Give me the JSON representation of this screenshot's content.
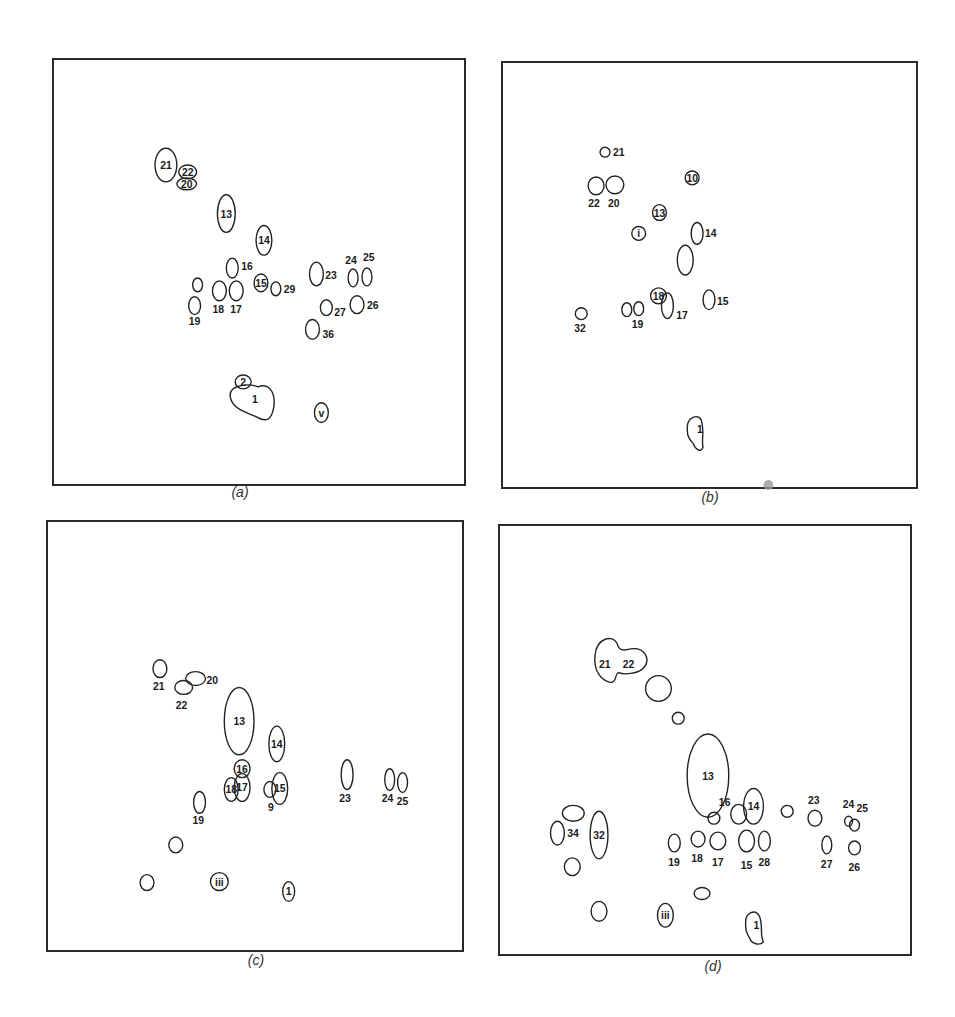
{
  "figure": {
    "panels": [
      {
        "id": "a",
        "caption": "(a)",
        "spots": [
          {
            "label": "21",
            "cx": 113,
            "cy": 106,
            "rx": 11,
            "ry": 17,
            "label_inside": true
          },
          {
            "label": "22",
            "cx": 135,
            "cy": 113,
            "rx": 9,
            "ry": 7,
            "label_inside": true
          },
          {
            "label": "20",
            "cx": 134,
            "cy": 125,
            "rx": 10,
            "ry": 6,
            "label_inside": true
          },
          {
            "label": "13",
            "cx": 174,
            "cy": 155,
            "rx": 9,
            "ry": 19,
            "label_inside": true
          },
          {
            "label": "14",
            "cx": 212,
            "cy": 182,
            "rx": 8,
            "ry": 15,
            "label_inside": true
          },
          {
            "label": "16",
            "cx": 180,
            "cy": 210,
            "rx": 6,
            "ry": 10,
            "label_x": 189,
            "label_y": 212
          },
          {
            "label": "15",
            "cx": 209,
            "cy": 225,
            "rx": 7,
            "ry": 9,
            "label_inside": true
          },
          {
            "label": "29",
            "cx": 224,
            "cy": 231,
            "rx": 5,
            "ry": 7,
            "label_x": 232,
            "label_y": 235
          },
          {
            "label": "",
            "cx": 145,
            "cy": 227,
            "rx": 5,
            "ry": 7
          },
          {
            "label": "19",
            "cx": 142,
            "cy": 248,
            "rx": 6,
            "ry": 9,
            "label_x": 136,
            "label_y": 268
          },
          {
            "label": "18",
            "cx": 167,
            "cy": 233,
            "rx": 7,
            "ry": 10,
            "label_x": 160,
            "label_y": 255
          },
          {
            "label": "17",
            "cx": 184,
            "cy": 233,
            "rx": 7,
            "ry": 10,
            "label_x": 178,
            "label_y": 255
          },
          {
            "label": "23",
            "cx": 265,
            "cy": 216,
            "rx": 7,
            "ry": 12,
            "label_x": 274,
            "label_y": 221
          },
          {
            "label": "24",
            "cx": 302,
            "cy": 220,
            "rx": 5,
            "ry": 9,
            "label_x": 294,
            "label_y": 206
          },
          {
            "label": "25",
            "cx": 316,
            "cy": 219,
            "rx": 5,
            "ry": 9,
            "label_x": 312,
            "label_y": 203
          },
          {
            "label": "26",
            "cx": 306,
            "cy": 247,
            "rx": 7,
            "ry": 9,
            "label_x": 316,
            "label_y": 251
          },
          {
            "label": "27",
            "cx": 275,
            "cy": 250,
            "rx": 6,
            "ry": 8,
            "label_x": 283,
            "label_y": 258
          },
          {
            "label": "36",
            "cx": 261,
            "cy": 272,
            "rx": 7,
            "ry": 10,
            "label_x": 271,
            "label_y": 281
          },
          {
            "label": "2",
            "cx": 191,
            "cy": 325,
            "rx": 8,
            "ry": 7,
            "label_inside": true
          },
          {
            "label": "1",
            "shape": "blob1",
            "label_x": 200,
            "label_y": 346
          },
          {
            "label": "v",
            "cx": 270,
            "cy": 356,
            "rx": 7,
            "ry": 10,
            "label_inside": true
          }
        ],
        "stains": []
      },
      {
        "id": "b",
        "caption": "(b)",
        "spots": [
          {
            "label": "21",
            "cx": 103,
            "cy": 90,
            "rx": 5,
            "ry": 5,
            "label_x": 111,
            "label_y": 94
          },
          {
            "label": "22",
            "cx": 94,
            "cy": 124,
            "rx": 8,
            "ry": 9,
            "label_x": 86,
            "label_y": 145
          },
          {
            "label": "20",
            "cx": 113,
            "cy": 123,
            "rx": 9,
            "ry": 9,
            "label_x": 106,
            "label_y": 145
          },
          {
            "label": "10",
            "cx": 191,
            "cy": 116,
            "rx": 7,
            "ry": 7,
            "label_inside": true
          },
          {
            "label": "13",
            "cx": 158,
            "cy": 151,
            "rx": 7,
            "ry": 8,
            "label_inside": true
          },
          {
            "label": "i",
            "cx": 137,
            "cy": 172,
            "rx": 7,
            "ry": 7,
            "label_inside": true
          },
          {
            "label": "14",
            "cx": 196,
            "cy": 172,
            "rx": 6,
            "ry": 11,
            "label_x": 204,
            "label_y": 176
          },
          {
            "label": "",
            "cx": 184,
            "cy": 199,
            "rx": 8,
            "ry": 15
          },
          {
            "label": "18",
            "cx": 157,
            "cy": 235,
            "rx": 8,
            "ry": 8,
            "label_inside": true
          },
          {
            "label": "17",
            "cx": 166,
            "cy": 245,
            "rx": 6,
            "ry": 13,
            "label_x": 175,
            "label_y": 258
          },
          {
            "label": "15",
            "cx": 208,
            "cy": 239,
            "rx": 6,
            "ry": 10,
            "label_x": 216,
            "label_y": 244
          },
          {
            "label": "",
            "cx": 125,
            "cy": 249,
            "rx": 5,
            "ry": 7
          },
          {
            "label": "19",
            "cx": 137,
            "cy": 248,
            "rx": 5,
            "ry": 7,
            "label_x": 130,
            "label_y": 268
          },
          {
            "label": "32",
            "cx": 79,
            "cy": 253,
            "rx": 6,
            "ry": 6,
            "label_x": 72,
            "label_y": 272
          },
          {
            "label": "1",
            "shape": "blob1b",
            "label_x": 196,
            "label_y": 374
          }
        ],
        "stains": [
          {
            "cx": 268,
            "cy": 426,
            "r": 5
          }
        ]
      },
      {
        "id": "c",
        "caption": "(c)",
        "spots": [
          {
            "label": "21",
            "cx": 113,
            "cy": 148,
            "rx": 7,
            "ry": 9,
            "label_x": 106,
            "label_y": 170
          },
          {
            "label": "22",
            "cx": 137,
            "cy": 167,
            "rx": 9,
            "ry": 7,
            "label_x": 129,
            "label_y": 189
          },
          {
            "label": "20",
            "cx": 149,
            "cy": 158,
            "rx": 10,
            "ry": 7,
            "label_x": 160,
            "label_y": 163
          },
          {
            "label": "13",
            "cx": 193,
            "cy": 201,
            "rx": 15,
            "ry": 34,
            "label_inside": true
          },
          {
            "label": "14",
            "cx": 231,
            "cy": 224,
            "rx": 8,
            "ry": 18,
            "label_inside": true
          },
          {
            "label": "16",
            "cx": 196,
            "cy": 249,
            "rx": 8,
            "ry": 9,
            "label_inside": true
          },
          {
            "label": "18",
            "cx": 185,
            "cy": 270,
            "rx": 7,
            "ry": 12,
            "label_inside": true
          },
          {
            "label": "17",
            "cx": 196,
            "cy": 268,
            "rx": 8,
            "ry": 14,
            "label_inside": true
          },
          {
            "label": "9",
            "cx": 224,
            "cy": 270,
            "rx": 6,
            "ry": 8,
            "label_x": 222,
            "label_y": 292
          },
          {
            "label": "15",
            "cx": 234,
            "cy": 269,
            "rx": 8,
            "ry": 16,
            "label_inside": true
          },
          {
            "label": "19",
            "cx": 153,
            "cy": 283,
            "rx": 6,
            "ry": 11,
            "label_x": 146,
            "label_y": 305
          },
          {
            "label": "23",
            "cx": 302,
            "cy": 255,
            "rx": 6,
            "ry": 15,
            "label_x": 294,
            "label_y": 283
          },
          {
            "label": "24",
            "cx": 345,
            "cy": 260,
            "rx": 5,
            "ry": 11,
            "label_x": 337,
            "label_y": 283
          },
          {
            "label": "25",
            "cx": 358,
            "cy": 263,
            "rx": 5,
            "ry": 10,
            "label_x": 352,
            "label_y": 286
          },
          {
            "label": "",
            "cx": 129,
            "cy": 326,
            "rx": 7,
            "ry": 8
          },
          {
            "label": "",
            "cx": 100,
            "cy": 364,
            "rx": 7,
            "ry": 8
          },
          {
            "label": "iii",
            "cx": 173,
            "cy": 363,
            "rx": 9,
            "ry": 9,
            "label_inside": true
          },
          {
            "label": "1",
            "cx": 243,
            "cy": 373,
            "rx": 6,
            "ry": 10,
            "label_inside": true
          }
        ],
        "stains": []
      },
      {
        "id": "d",
        "caption": "(d)",
        "spots": [
          {
            "label": "21 22",
            "shape": "blob2122",
            "label_x": 104,
            "label_y": 143
          },
          {
            "label": "",
            "cx": 160,
            "cy": 164,
            "rx": 13,
            "ry": 13
          },
          {
            "label": "",
            "cx": 180,
            "cy": 194,
            "rx": 6,
            "ry": 6
          },
          {
            "label": "13",
            "cx": 210,
            "cy": 252,
            "rx": 21,
            "ry": 42,
            "label_inside": true
          },
          {
            "label": "14",
            "cx": 256,
            "cy": 283,
            "rx": 10,
            "ry": 18,
            "label_inside": true
          },
          {
            "label": "",
            "cx": 241,
            "cy": 291,
            "rx": 8,
            "ry": 10
          },
          {
            "label": "16",
            "cx": 216,
            "cy": 295,
            "rx": 6,
            "ry": 6,
            "label_x": 221,
            "label_y": 283
          },
          {
            "label": "",
            "cx": 290,
            "cy": 288,
            "rx": 6,
            "ry": 6
          },
          {
            "label": "23",
            "cx": 318,
            "cy": 295,
            "rx": 7,
            "ry": 8,
            "label_x": 311,
            "label_y": 281
          },
          {
            "label": "24",
            "cx": 352,
            "cy": 298,
            "rx": 4,
            "ry": 5,
            "label_x": 346,
            "label_y": 285
          },
          {
            "label": "25",
            "cx": 358,
            "cy": 302,
            "rx": 5,
            "ry": 6,
            "label_x": 360,
            "label_y": 289
          },
          {
            "label": "",
            "cx": 74,
            "cy": 290,
            "rx": 11,
            "ry": 8
          },
          {
            "label": "34",
            "cx": 58,
            "cy": 310,
            "rx": 7,
            "ry": 12,
            "label_x": 68,
            "label_y": 314
          },
          {
            "label": "32",
            "cx": 100,
            "cy": 312,
            "rx": 9,
            "ry": 24,
            "label_inside": true
          },
          {
            "label": "",
            "cx": 73,
            "cy": 344,
            "rx": 8,
            "ry": 9
          },
          {
            "label": "19",
            "cx": 176,
            "cy": 320,
            "rx": 6,
            "ry": 9,
            "label_x": 170,
            "label_y": 343
          },
          {
            "label": "18",
            "cx": 200,
            "cy": 316,
            "rx": 7,
            "ry": 8,
            "label_x": 193,
            "label_y": 339
          },
          {
            "label": "17",
            "cx": 220,
            "cy": 318,
            "rx": 8,
            "ry": 9,
            "label_x": 214,
            "label_y": 343
          },
          {
            "label": "15",
            "cx": 249,
            "cy": 318,
            "rx": 8,
            "ry": 11,
            "label_x": 243,
            "label_y": 346
          },
          {
            "label": "28",
            "cx": 267,
            "cy": 318,
            "rx": 6,
            "ry": 10,
            "label_x": 261,
            "label_y": 343
          },
          {
            "label": "27",
            "cx": 330,
            "cy": 322,
            "rx": 5,
            "ry": 9,
            "label_x": 324,
            "label_y": 345
          },
          {
            "label": "26",
            "cx": 358,
            "cy": 325,
            "rx": 6,
            "ry": 7,
            "label_x": 352,
            "label_y": 348
          },
          {
            "label": "",
            "cx": 204,
            "cy": 371,
            "rx": 8,
            "ry": 6
          },
          {
            "label": "",
            "cx": 100,
            "cy": 389,
            "rx": 8,
            "ry": 10
          },
          {
            "label": "iii",
            "cx": 167,
            "cy": 393,
            "rx": 8,
            "ry": 12,
            "label_inside": true
          },
          {
            "label": "1",
            "shape": "blob1d",
            "label_x": 256,
            "label_y": 407
          }
        ],
        "stains": []
      }
    ]
  }
}
